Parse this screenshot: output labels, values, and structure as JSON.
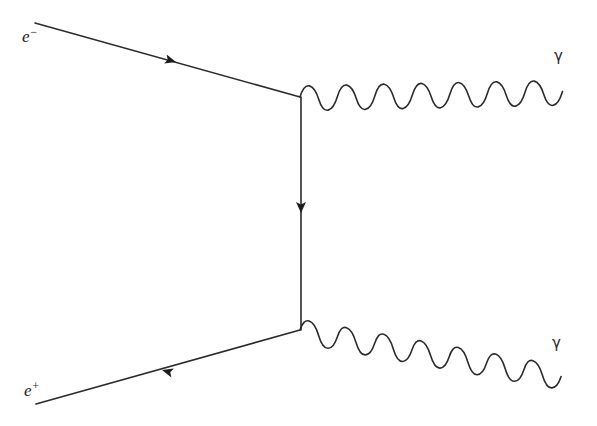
{
  "figure": {
    "kind": "feynman-diagram",
    "process": "electron-positron annihilation to two photons",
    "background_color": "#ffffff",
    "line_color": "#2b2b2b",
    "width": 597,
    "height": 426
  },
  "labels": {
    "electron_symbol": "e",
    "electron_charge": "−",
    "positron_symbol": "e",
    "positron_charge": "+",
    "photon_top": "γ",
    "photon_bottom": "γ"
  },
  "geometry": {
    "vertex_top": {
      "x": 300,
      "y": 97
    },
    "vertex_bottom": {
      "x": 300,
      "y": 330
    },
    "electron_line": {
      "x1": 35,
      "y1": 23,
      "x2": 300,
      "y2": 97
    },
    "positron_line": {
      "x1": 300,
      "y1": 330,
      "x2": 36,
      "y2": 404
    },
    "internal_line": {
      "x1": 301,
      "y1": 97,
      "x2": 301,
      "y2": 330
    },
    "photon_top": {
      "x1": 300,
      "y1": 97,
      "x2": 562,
      "y2": 33,
      "waves": 7,
      "amplitude": 11
    },
    "photon_bottom": {
      "x1": 300,
      "y1": 330,
      "x2": 563,
      "y2": 400,
      "waves": 7,
      "amplitude": 11
    },
    "arrow_electron": {
      "x": 166,
      "y": 57,
      "direction": "toward-vertex"
    },
    "arrow_positron": {
      "x": 168,
      "y": 369,
      "direction": "away-from-vertex"
    },
    "arrow_internal": {
      "x": 301,
      "y": 207,
      "direction": "down"
    }
  },
  "label_positions": {
    "electron": {
      "x": 22,
      "y": 42
    },
    "positron": {
      "x": 24,
      "y": 396
    },
    "photon_top": {
      "x": 554,
      "y": 61
    },
    "photon_bottom": {
      "x": 552,
      "y": 348
    }
  }
}
